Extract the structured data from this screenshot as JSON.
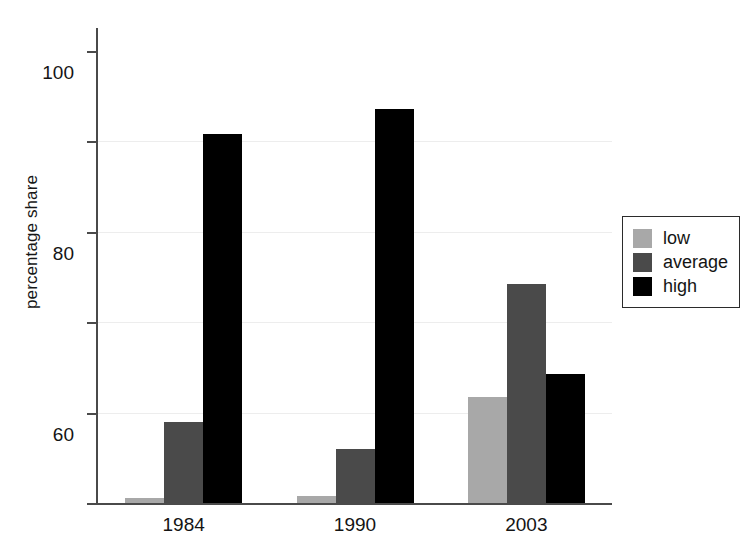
{
  "chart_data": {
    "type": "bar",
    "title": "",
    "xlabel": "",
    "ylabel": "percentage share",
    "categories": [
      "1984",
      "1990",
      "2003"
    ],
    "series": [
      {
        "name": "low",
        "color": "#a8a8a8",
        "values": [
          1.0,
          1.5,
          23.5
        ]
      },
      {
        "name": "average",
        "color": "#4a4a4a",
        "values": [
          18.0,
          12.0,
          48.5
        ]
      },
      {
        "name": "high",
        "color": "#000000",
        "values": [
          81.5,
          87.0,
          28.5
        ]
      }
    ],
    "ylim": [
      0,
      105
    ],
    "yticks": [
      0,
      20,
      40,
      60,
      80,
      100
    ],
    "ytick_labels": [
      "0",
      "20",
      "40",
      "60",
      "80",
      "100"
    ],
    "grid": true,
    "gridlines_at": [
      20,
      40,
      60,
      80
    ],
    "legend_position": "right"
  },
  "legend": {
    "items": [
      {
        "label": "low",
        "color": "#a8a8a8"
      },
      {
        "label": "average",
        "color": "#4a4a4a"
      },
      {
        "label": "high",
        "color": "#000000"
      }
    ]
  }
}
